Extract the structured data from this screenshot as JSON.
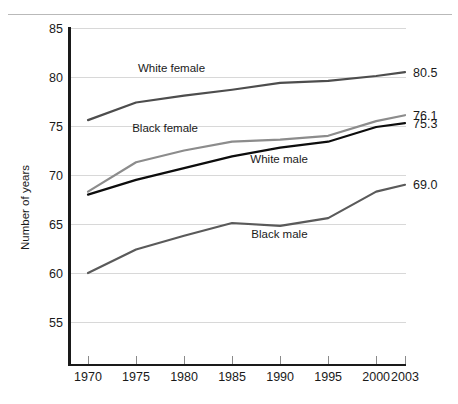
{
  "chart_data": {
    "type": "line",
    "title": "",
    "xlabel": "",
    "ylabel": "Number of years",
    "x": [
      1970,
      1975,
      1980,
      1985,
      1990,
      1995,
      2000,
      2003
    ],
    "xtick_labels": [
      "1970",
      "1975",
      "1980",
      "1985",
      "1990",
      "1995",
      "2000",
      "2003"
    ],
    "ytick_labels": [
      "85",
      "80",
      "75",
      "70",
      "65",
      "60",
      "55"
    ],
    "yticks": [
      85,
      80,
      75,
      70,
      65,
      60,
      55
    ],
    "xlim": [
      1970,
      2003
    ],
    "ylim": [
      53,
      85
    ],
    "grid": true,
    "legend_position": "inline-annotations",
    "series": [
      {
        "name": "White female",
        "label": "White female",
        "color": "#4d4d4d",
        "end_value_label": "80.5",
        "values": [
          75.6,
          77.4,
          78.1,
          78.7,
          79.4,
          79.6,
          80.1,
          80.5
        ],
        "label_x": 1975.2,
        "label_y": 80.55
      },
      {
        "name": "Black female",
        "label": "Black female",
        "color": "#8c8c8c",
        "end_value_label": "76.1",
        "values": [
          68.3,
          71.3,
          72.5,
          73.4,
          73.6,
          74.0,
          75.5,
          76.1
        ],
        "label_x": 1974.6,
        "label_y": 74.35
      },
      {
        "name": "White male",
        "label": "White male",
        "color": "#0d0d0d",
        "end_value_label": "75.3",
        "values": [
          68.0,
          69.5,
          70.7,
          71.9,
          72.8,
          73.4,
          74.9,
          75.3
        ],
        "label_x": 1986.9,
        "label_y": 71.2
      },
      {
        "name": "Black male",
        "label": "Black male",
        "color": "#5a5a5a",
        "end_value_label": "69.0",
        "values": [
          60.0,
          62.4,
          63.8,
          65.1,
          64.8,
          65.6,
          68.3,
          69.0
        ],
        "label_x": 1987.0,
        "label_y": 63.6
      }
    ],
    "end_labels": [
      "80.5",
      "76.1",
      "75.3",
      "69.0"
    ]
  }
}
